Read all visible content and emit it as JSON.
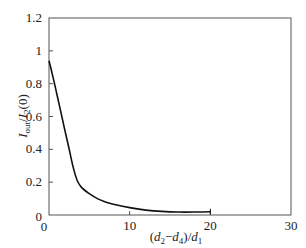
{
  "chart_data": {
    "type": "line",
    "title": "",
    "xlabel": "(d2−d4)/d1",
    "xlabel_parts": {
      "open": "(",
      "d2": "d",
      "d2_sub": "2",
      "minus": "−",
      "d4": "d",
      "d4_sub": "4",
      "close": ")/",
      "d1": "d",
      "d1_sub": "1"
    },
    "ylabel": "Iout/I2(0)",
    "ylabel_parts": {
      "I1": "I",
      "I1_sub": "out",
      "slash": "/",
      "I2": "I",
      "I2_sub": "2",
      "arg": "(0)"
    },
    "xlim": [
      0,
      30
    ],
    "ylim": [
      0,
      1.2
    ],
    "xticks": [
      0,
      10,
      20,
      30
    ],
    "xtick_labels": [
      "0",
      "10",
      "20",
      "30"
    ],
    "yticks": [
      0,
      0.2,
      0.4,
      0.6,
      0.8,
      1,
      1.2
    ],
    "ytick_labels": [
      "0",
      "0.2",
      "0.4",
      "0.6",
      "0.8",
      "1",
      "1.2"
    ],
    "grid": false,
    "legend": null,
    "series": [
      {
        "name": "Iout/I2(0)",
        "x": [
          0,
          0.5,
          1,
          1.5,
          2,
          2.5,
          3,
          3.5,
          4,
          5,
          6,
          7,
          8,
          10,
          12,
          14,
          16,
          18,
          20
        ],
        "values": [
          0.94,
          0.84,
          0.73,
          0.62,
          0.51,
          0.4,
          0.29,
          0.21,
          0.17,
          0.13,
          0.1,
          0.08,
          0.065,
          0.045,
          0.03,
          0.022,
          0.018,
          0.018,
          0.02
        ]
      }
    ]
  }
}
